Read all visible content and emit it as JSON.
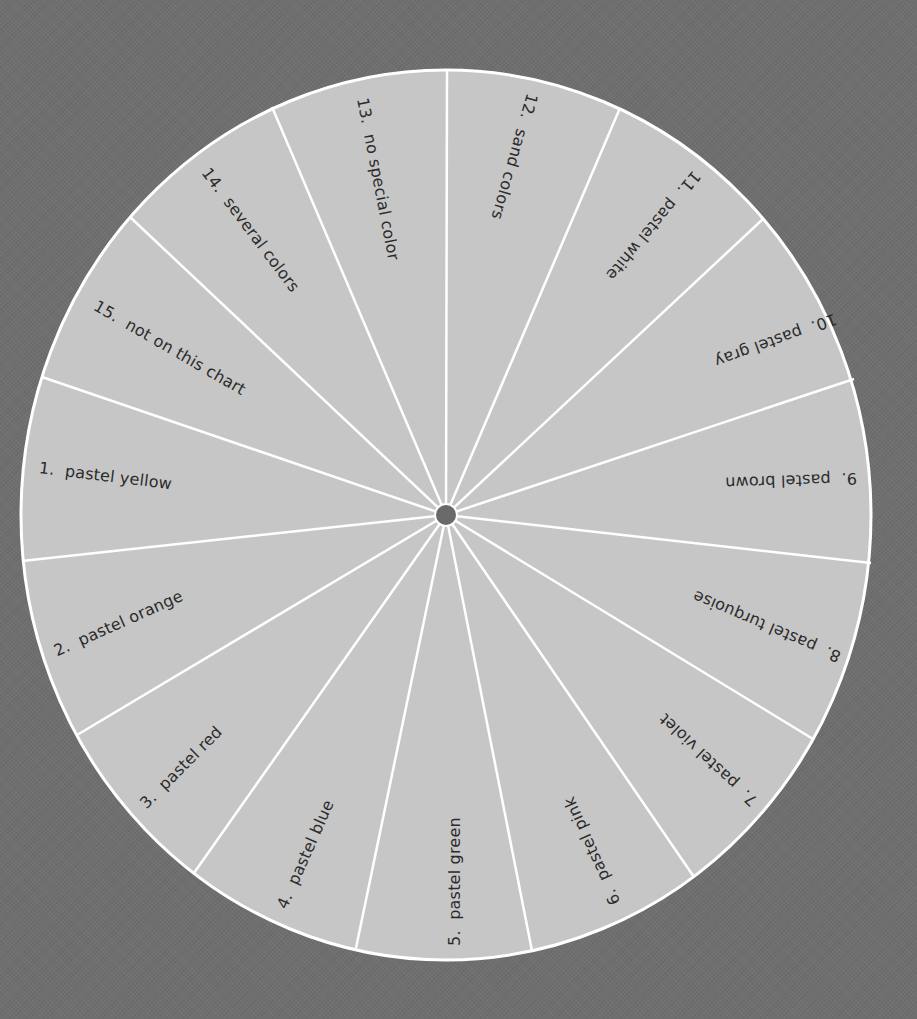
{
  "wheel": {
    "center": {
      "x": 446,
      "y": 515
    },
    "radius_x": 425,
    "radius_y": 445,
    "hub_radius": 11,
    "colors": {
      "background": "#6f6f6f",
      "segment_fill": "#c6c6c6",
      "divider": "#ffffff",
      "hub": "#6a6a6a",
      "text": "#2b2b2b"
    },
    "divider_rim_points": [
      [
        447,
        70
      ],
      [
        620,
        108
      ],
      [
        763,
        219
      ],
      [
        854,
        379
      ],
      [
        871,
        563
      ],
      [
        813,
        739
      ],
      [
        694,
        877
      ],
      [
        532,
        951
      ],
      [
        356,
        948
      ],
      [
        194,
        873
      ],
      [
        77,
        735
      ],
      [
        22,
        561
      ],
      [
        42,
        377
      ],
      [
        130,
        217
      ],
      [
        272,
        107
      ]
    ],
    "segments": [
      {
        "label": "1.  pastel yellow",
        "x": 39,
        "y": 468,
        "angle": 7
      },
      {
        "label": "2.  pastel orange",
        "x": 55,
        "y": 652,
        "angle": -24
      },
      {
        "label": "3.  pastel red",
        "x": 143,
        "y": 806,
        "angle": -45
      },
      {
        "label": "4.  pastel blue",
        "x": 282,
        "y": 908,
        "angle": -66
      },
      {
        "label": "5.  pastel green",
        "x": 455,
        "y": 946,
        "angle": -90
      },
      {
        "label": "6.  pastel pink",
        "x": 616,
        "y": 904,
        "angle": -114
      },
      {
        "label": "7.  pastel violet",
        "x": 755,
        "y": 803,
        "angle": -137
      },
      {
        "label": "8.  pastel turquoise",
        "x": 840,
        "y": 657,
        "angle": -157
      },
      {
        "label": "9.  pastel brown",
        "x": 857,
        "y": 478,
        "angle": 178
      },
      {
        "label": "10.  pastel gray",
        "x": 836,
        "y": 318,
        "angle": 160
      },
      {
        "label": "11.  pastel white",
        "x": 697,
        "y": 173,
        "angle": 130
      },
      {
        "label": "12.  sand colors",
        "x": 532,
        "y": 94,
        "angle": 106
      },
      {
        "label": "13.  no special color",
        "x": 362,
        "y": 98,
        "angle": 79
      },
      {
        "label": "14.  several colors",
        "x": 205,
        "y": 170,
        "angle": 53
      },
      {
        "label": "15.  not on this chart",
        "x": 95,
        "y": 305,
        "angle": 30
      }
    ]
  }
}
